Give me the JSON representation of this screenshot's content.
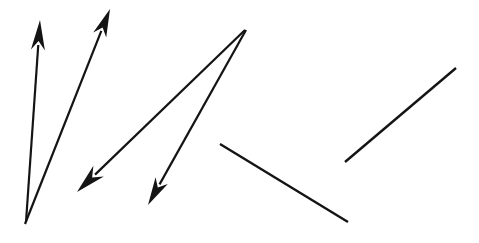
{
  "canvas": {
    "width": 479,
    "height": 243,
    "background_color": "#ffffff",
    "stroke_color": "#141414"
  },
  "figure": {
    "shape_count": 6,
    "arrow_count": 4,
    "plain_line_count": 2
  },
  "shapes": [
    {
      "id": "arrow-1",
      "type": "arrow",
      "label": "Arrow 1 up-left-vertical",
      "x1": 26,
      "y1": 222,
      "x2": 40,
      "y2": 20,
      "stroke_width": 2.2,
      "head_length": 30,
      "head_half_width": 7,
      "head_notch": 9
    },
    {
      "id": "arrow-2",
      "type": "arrow",
      "label": "Arrow 2 up-right steep",
      "x1": 25,
      "y1": 224,
      "x2": 110,
      "y2": 9,
      "stroke_width": 2.2,
      "head_length": 28,
      "head_half_width": 7,
      "head_notch": 8
    },
    {
      "id": "arrow-3",
      "type": "arrow",
      "label": "Arrow 3 down-left long diagonal",
      "x1": 245,
      "y1": 30,
      "x2": 77,
      "y2": 192,
      "stroke_width": 2.2,
      "head_length": 30,
      "head_half_width": 7.5,
      "head_notch": 9
    },
    {
      "id": "arrow-4",
      "type": "arrow",
      "label": "Arrow 4 down-left steep",
      "x1": 246,
      "y1": 30,
      "x2": 148,
      "y2": 205,
      "stroke_width": 2.2,
      "head_length": 28,
      "head_half_width": 7,
      "head_notch": 8
    },
    {
      "id": "line-1",
      "type": "line",
      "label": "Line 1 descending to the right",
      "x1": 220,
      "y1": 144,
      "x2": 348,
      "y2": 222,
      "stroke_width": 2.4
    },
    {
      "id": "line-2",
      "type": "line",
      "label": "Line 2 ascending to the right",
      "x1": 345,
      "y1": 162,
      "x2": 456,
      "y2": 68,
      "stroke_width": 2.4
    }
  ]
}
